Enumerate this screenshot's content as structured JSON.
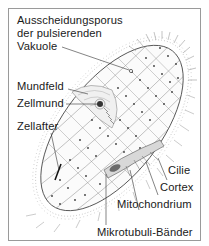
{
  "diagram": {
    "labels": {
      "excretory_pore_line1": "Ausscheidungsporus",
      "excretory_pore_line2": "der pulsierenden",
      "excretory_pore_line3": "Vakuole",
      "oral_groove": "Mundfeld",
      "cytostome": "Zellmund",
      "cytoproct": "Zellafter",
      "cilium": "Cilie",
      "cortex": "Cortex",
      "mitochondrion": "Mitochondrium",
      "microtubule_bands": "Mikrotubuli-Bänder"
    },
    "colors": {
      "line": "#2a2a2a",
      "light_line": "#8a8a8a",
      "frame": "#9a9a9a",
      "text": "#1a1a1a"
    }
  }
}
